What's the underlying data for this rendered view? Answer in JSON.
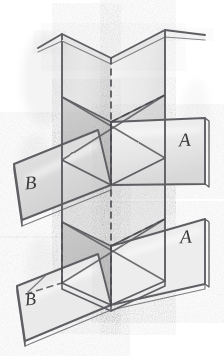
{
  "figure": {
    "medium": "pencil sketch on white paper",
    "background_color": "#ffffff",
    "ink_color": "#5b5b60",
    "dark_ink_color": "#3a3a3c",
    "shade_light": "#efefef",
    "shade_mid": "#dcdcdc",
    "shade_dark": "#c4c4c4",
    "shade_darkest": "#ababab",
    "highlight_color": "#fbfbfb",
    "width": 224,
    "height": 356
  },
  "labels": [
    {
      "id": "label-a-upper",
      "text": "A",
      "x": 185,
      "y": 146,
      "size": 19,
      "rotate": -4
    },
    {
      "id": "label-a-lower",
      "text": "A",
      "x": 186,
      "y": 243,
      "size": 19,
      "rotate": -3
    },
    {
      "id": "label-b-upper",
      "text": "B",
      "x": 31,
      "y": 189,
      "size": 19,
      "rotate": -5
    },
    {
      "id": "label-b-lower",
      "text": "B",
      "x": 31,
      "y": 305,
      "size": 18,
      "rotate": -6
    }
  ],
  "geometry": {
    "center_axis_x": 111,
    "fold_line_style": "dashed",
    "panel_count": 8,
    "notes": "Two vertical panel columns meeting at a central dashed fold axis, crossed by four outward-flaring parallelogram wings labelled A (right) and B (left)."
  },
  "panels": {
    "top_left_wing": "upper-left slanted panel",
    "top_right_wing": "upper-right slanted panel",
    "wing_a_upper": "right parallelogram labelled A",
    "wing_a_lower": "right lower parallelogram labelled A",
    "wing_b_upper": "left parallelogram labelled B",
    "wing_b_lower": "left lower parallelogram labelled B",
    "core_upper": "central upper triangular facet",
    "core_lower": "central lower triangular facet"
  }
}
